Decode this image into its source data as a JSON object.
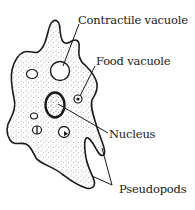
{
  "diagram": {
    "labels": {
      "contractile_vacuole": "Contractile vacuole",
      "food_vacuole": "Food vacuole",
      "nucleus": "Nucleus",
      "pseudopods": "Pseudopods"
    },
    "colors": {
      "outline": "#1a1a1a",
      "cytoplasm_stipple": "#555555",
      "background": "#ffffff"
    }
  }
}
